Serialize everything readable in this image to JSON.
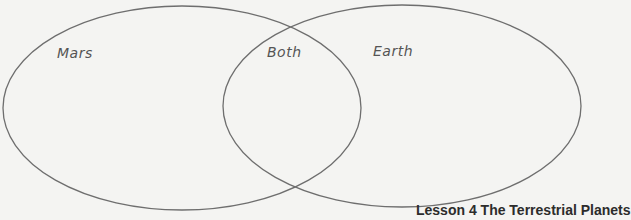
{
  "diagram": {
    "type": "venn",
    "sets": [
      {
        "label": "Mars",
        "cx": 182,
        "cy": 108,
        "rx": 179,
        "ry": 102
      },
      {
        "label": "Earth",
        "cx": 402,
        "cy": 106,
        "rx": 179,
        "ry": 101
      }
    ],
    "intersection_label": "Both",
    "stroke_color": "#6e6e6e",
    "background": "#f4f4f2"
  },
  "labels": {
    "mars": "Mars",
    "both": "Both",
    "earth": "Earth"
  },
  "footer": {
    "text": "Lesson 4 The Terrestrial Planets"
  }
}
